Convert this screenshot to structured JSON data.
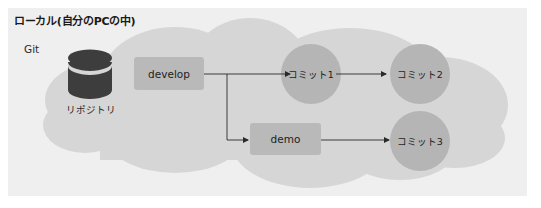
{
  "diagram": {
    "title": "ローカル(自分のPCの中)",
    "git_label": "Git",
    "repository": {
      "label": "リポジトリ",
      "icon": "database-icon"
    },
    "branches": [
      {
        "id": "develop",
        "label": "develop"
      },
      {
        "id": "demo",
        "label": "demo"
      }
    ],
    "commits": [
      {
        "id": "commit1",
        "label": "コミット1"
      },
      {
        "id": "commit2",
        "label": "コミット2"
      },
      {
        "id": "commit3",
        "label": "コミット3"
      }
    ],
    "edges": [
      {
        "from": "develop",
        "to": "commit1"
      },
      {
        "from": "develop",
        "to": "demo"
      },
      {
        "from": "commit1",
        "to": "commit2"
      },
      {
        "from": "demo",
        "to": "commit3"
      }
    ],
    "colors": {
      "panel_background": "#efefef",
      "cloud": "#d6d6d6",
      "branch_box": "#b9b9b9",
      "commit_circle": "#b5b5b5",
      "repo_icon": "#3d3d3d",
      "connector": "#2a2a2a"
    }
  }
}
